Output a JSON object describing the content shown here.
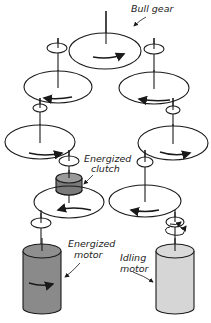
{
  "diagram": {
    "type": "gear-train-schematic",
    "labels": {
      "bull_gear": "Bull gear",
      "clutch_line1": "Energized",
      "clutch_line2": "clutch",
      "energized_motor_line1": "Energized",
      "energized_motor_line2": "motor",
      "idling_motor_line1": "Idling",
      "idling_motor_line2": "motor"
    },
    "colors": {
      "line": "#1a1a1a",
      "clutch_fill": "#7a7a7a",
      "energized_motor_fill": "#8a8a8a",
      "idling_motor_fill": "#d6d6d6"
    }
  }
}
